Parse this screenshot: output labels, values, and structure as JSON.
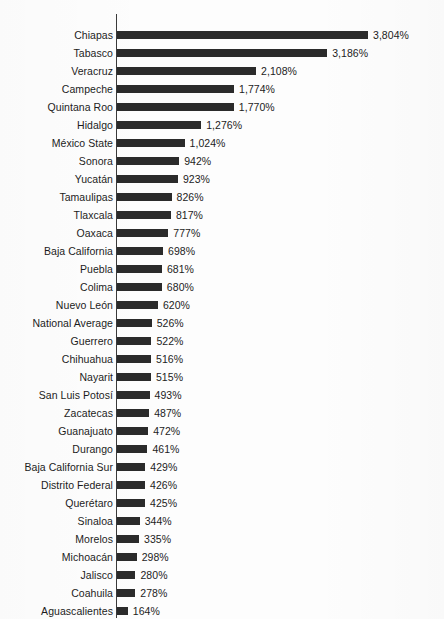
{
  "chart_data": {
    "type": "bar",
    "orientation": "horizontal",
    "title": "",
    "subtitle": "",
    "xlabel": "",
    "ylabel": "",
    "grid": false,
    "legend": null,
    "axis_line": "category",
    "value_unit": "%",
    "xlim": [
      0,
      3804
    ],
    "bar_color": "#2b2b2b",
    "text_color": "#1c1c1c",
    "background_color": "#fdfdfd",
    "categories": [
      "Chiapas",
      "Tabasco",
      "Veracruz",
      "Campeche",
      "Quintana Roo",
      "Hidalgo",
      "México State",
      "Sonora",
      "Yucatán",
      "Tamaulipas",
      "Tlaxcala",
      "Oaxaca",
      "Baja California",
      "Puebla",
      "Colima",
      "Nuevo León",
      "National Average",
      "Guerrero",
      "Chihuahua",
      "Nayarit",
      "San Luis Potosí",
      "Zacatecas",
      "Guanajuato",
      "Durango",
      "Baja California Sur",
      "Distrito Federal",
      "Querétaro",
      "Sinaloa",
      "Morelos",
      "Michoacán",
      "Jalisco",
      "Coahuila",
      "Aguascalientes"
    ],
    "values": [
      3804,
      3186,
      2108,
      1774,
      1770,
      1276,
      1024,
      942,
      923,
      826,
      817,
      777,
      698,
      681,
      680,
      620,
      526,
      522,
      516,
      515,
      493,
      487,
      472,
      461,
      429,
      426,
      425,
      344,
      335,
      298,
      280,
      278,
      164
    ],
    "value_labels": [
      "3,804%",
      "3,186%",
      "2,108%",
      "1,774%",
      "1,770%",
      "1,276%",
      "1,024%",
      "942%",
      "923%",
      "826%",
      "817%",
      "777%",
      "698%",
      "681%",
      "680%",
      "620%",
      "526%",
      "522%",
      "516%",
      "515%",
      "493%",
      "487%",
      "472%",
      "461%",
      "429%",
      "426%",
      "425%",
      "344%",
      "335%",
      "298%",
      "280%",
      "278%",
      "164%"
    ]
  }
}
